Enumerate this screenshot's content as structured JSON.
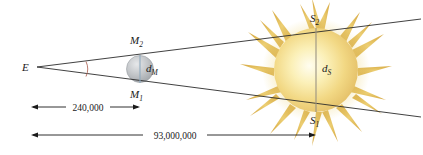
{
  "figure": {
    "background_color": "#ffffff"
  },
  "labels": {
    "earth": {
      "text": "E",
      "x": 22,
      "y": 71
    },
    "moon_top": {
      "base": "M",
      "sub": "2",
      "x": 130,
      "y": 44
    },
    "moon_bottom": {
      "base": "M",
      "sub": "1",
      "x": 130,
      "y": 98
    },
    "moon_diameter": {
      "base": "d",
      "sub": "M",
      "x": 154,
      "y": 72
    },
    "sun_top": {
      "base": "S",
      "sub": "2",
      "x": 310,
      "y": 22
    },
    "sun_bottom": {
      "base": "S",
      "sub": "1",
      "x": 310,
      "y": 124
    },
    "sun_diameter": {
      "base": "d",
      "sub": "S",
      "x": 324,
      "y": 72
    }
  },
  "dimensions": [
    {
      "name": "earth-to-moon",
      "value": "240,000",
      "x1": 31,
      "x2": 140,
      "y": 107,
      "text_x": 86,
      "text_y": 110
    },
    {
      "name": "earth-to-sun",
      "value": "93,000,000",
      "x1": 31,
      "x2": 316,
      "y": 135,
      "text_x": 174,
      "text_y": 138
    }
  ],
  "geometry": {
    "apex": {
      "x": 37,
      "y": 67
    },
    "upper_ray_end": {
      "x": 421,
      "y": 19
    },
    "lower_ray_end": {
      "x": 421,
      "y": 117
    },
    "moon": {
      "cx": 140,
      "cy": 69,
      "r": 13.5,
      "top_y": 55,
      "bottom_y": 83
    },
    "sun": {
      "cx": 316,
      "cy": 70,
      "core_r": 42,
      "top_y": 28,
      "bottom_y": 112
    },
    "angle_arc": {
      "x": 86,
      "top_y": 61,
      "bottom_y": 76
    }
  },
  "colors": {
    "ray": "#2b2b2b",
    "moon_fill": "#b9bcbf",
    "moon_highlight": "#e2e4e6",
    "moon_chord": "#8fa9bd",
    "sun_core": "#fdf6d8",
    "sun_mid": "#f3d77e",
    "sun_spike": "#d9ab3f",
    "sun_chord": "#9a9382",
    "angle_arc": "#b06a5c",
    "text": "#1a1a1a"
  }
}
